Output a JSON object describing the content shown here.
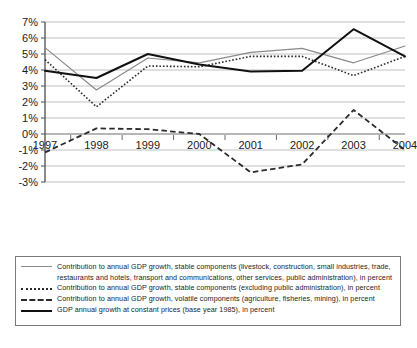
{
  "chart_data": {
    "type": "line",
    "title": "",
    "subtitle": "",
    "xlabel": "",
    "ylabel": "",
    "x": [
      "1997",
      "1998",
      "1999",
      "2000",
      "2001",
      "2002",
      "2003",
      "2004"
    ],
    "categories": [
      "1997",
      "1998",
      "1999",
      "2000",
      "2001",
      "2002",
      "2003",
      "2004"
    ],
    "ylim": [
      -3,
      7
    ],
    "yticks": [
      -3,
      -2,
      -1,
      0,
      1,
      2,
      3,
      4,
      5,
      6,
      7
    ],
    "ytick_labels": [
      "-3%",
      "-2%",
      "-1%",
      "0%",
      "1%",
      "2%",
      "3%",
      "4%",
      "5%",
      "6%",
      "7%"
    ],
    "grid": true,
    "grid_axis": "y",
    "legend_position": "below",
    "series": [
      {
        "name": "Contribution to annual GDP growth, stable components (livestock, construction, small industries, trade, restaurants and hotels, transport and communications, other services, public administration), in percent",
        "short_name": "stable-components-including-public-administration",
        "style": "solid",
        "color": "#8a8a8a",
        "width": 1.2,
        "values": [
          5.4,
          2.75,
          4.75,
          4.45,
          5.1,
          5.35,
          4.45,
          5.5
        ]
      },
      {
        "name": "Contribution to annual GDP growth, stable components (excluding public administration), in percent",
        "short_name": "stable-components-excluding-public-administration",
        "style": "dotted",
        "color": "#2b2b2b",
        "width": 1.6,
        "values": [
          4.65,
          1.7,
          4.25,
          4.2,
          4.85,
          4.85,
          3.65,
          4.85
        ]
      },
      {
        "name": "Contribution to annual GDP growth, volatile components (agriculture, fisheries, mining), in percent",
        "short_name": "volatile-components",
        "style": "dashed",
        "color": "#2b2b2b",
        "width": 1.8,
        "values": [
          -1.15,
          0.35,
          0.3,
          0.0,
          -2.4,
          -1.9,
          1.5,
          -1.0
        ]
      },
      {
        "name": "GDP annual growth at constant prices (base year 1985), in percent",
        "short_name": "gdp-annual-growth",
        "style": "solid",
        "color": "#111111",
        "width": 2.0,
        "values": [
          3.95,
          3.5,
          5.0,
          4.35,
          3.9,
          3.95,
          6.55,
          4.85
        ]
      }
    ]
  },
  "legend": {
    "items": [
      {
        "swatch": "solid-gray",
        "line1": "Contribution to annual GDP growth, stable components (livestock, construction, small industries, trade,",
        "line2": "restaurants and hotels, transport and communications, other services, public administration), in percent"
      },
      {
        "swatch": "dotted",
        "line1": "Contribution to annual GDP growth, stable components (excluding public administration), in percent",
        "line2": ""
      },
      {
        "swatch": "dashed",
        "line1": "Contribution to annual GDP growth, volatile components (agriculture, fisheries, mining), in percent",
        "line2": ""
      },
      {
        "swatch": "solid-black",
        "line1": "GDP annual growth at constant prices (base year 1985), in percent",
        "line2": ""
      }
    ]
  }
}
